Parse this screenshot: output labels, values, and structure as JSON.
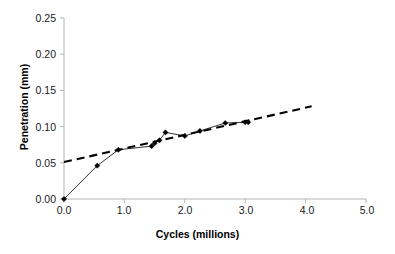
{
  "chart_data": {
    "type": "line",
    "title": "",
    "xlabel": "Cycles (millions)",
    "ylabel": "Penetration (mm)",
    "xlim": [
      0.0,
      5.0
    ],
    "ylim": [
      0.0,
      0.25
    ],
    "xticks": [
      "0.0",
      "1.0",
      "2.0",
      "3.0",
      "4.0",
      "5.0"
    ],
    "xtick_values": [
      0.0,
      1.0,
      2.0,
      3.0,
      4.0,
      5.0
    ],
    "yticks": [
      "0.00",
      "0.05",
      "0.10",
      "0.15",
      "0.20",
      "0.25"
    ],
    "ytick_values": [
      0.0,
      0.05,
      0.1,
      0.15,
      0.2,
      0.25
    ],
    "grid": false,
    "legend": "none",
    "series": [
      {
        "name": "Penetration measurements",
        "style": "solid-line-with-diamond-markers",
        "color": "#000000",
        "x": [
          0.0,
          0.55,
          0.9,
          1.45,
          1.5,
          1.58,
          1.68,
          2.0,
          2.25,
          2.67,
          3.0,
          3.05
        ],
        "y": [
          0.0,
          0.046,
          0.068,
          0.073,
          0.077,
          0.081,
          0.092,
          0.087,
          0.094,
          0.105,
          0.106,
          0.106
        ]
      },
      {
        "name": "Linear trend line",
        "style": "dashed",
        "color": "#000000",
        "x": [
          0.0,
          4.1
        ],
        "y": [
          0.051,
          0.128
        ]
      }
    ]
  },
  "axis": {
    "x_title": "Cycles (millions)",
    "y_title": "Penetration (mm)"
  },
  "colors": {
    "background": "#ffffff",
    "axis": "#b3b3b3",
    "data": "#000000",
    "text": "#1a1a1a"
  }
}
